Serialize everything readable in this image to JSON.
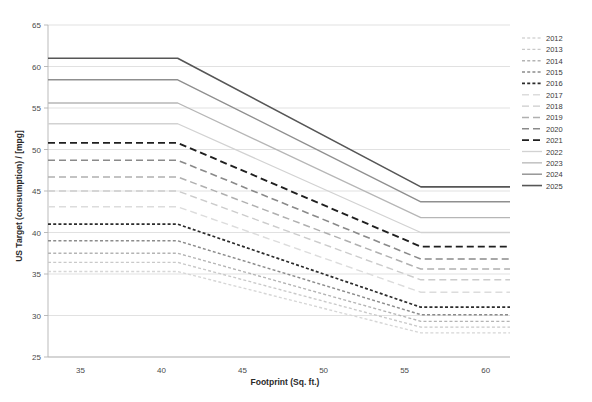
{
  "chart_data": {
    "type": "line",
    "title": "",
    "xlabel": "Footprint (Sq. ft.)",
    "ylabel": "US Target (consumption) / [mpg]",
    "xlim": [
      33,
      61.5
    ],
    "ylim": [
      25,
      65
    ],
    "xticks": [
      35,
      40,
      45,
      50,
      55,
      60
    ],
    "yticks": [
      25,
      30,
      35,
      40,
      45,
      50,
      55,
      60,
      65
    ],
    "grid": true,
    "legend_position": "right",
    "x": [
      33,
      41,
      56,
      61.5
    ],
    "series": [
      {
        "name": "2012",
        "label": "2012",
        "values": [
          35.3,
          35.3,
          27.9,
          27.9
        ],
        "color": "#d6d6d6",
        "dash": "3,2.2",
        "width": 1.35
      },
      {
        "name": "2013",
        "label": "2013",
        "values": [
          36.4,
          36.4,
          28.6,
          28.6
        ],
        "color": "#c9c9c9",
        "dash": "3,2.2",
        "width": 1.35
      },
      {
        "name": "2014",
        "label": "2014",
        "values": [
          37.5,
          37.5,
          29.3,
          29.3
        ],
        "color": "#b4b4b4",
        "dash": "3,2.2",
        "width": 1.35
      },
      {
        "name": "2015",
        "label": "2015",
        "values": [
          39.0,
          39.0,
          30.1,
          30.1
        ],
        "color": "#8c8c8c",
        "dash": "3,2.2",
        "width": 1.45
      },
      {
        "name": "2016",
        "label": "2016",
        "values": [
          41.0,
          41.0,
          31.0,
          31.0
        ],
        "color": "#2b2b2b",
        "dash": "3,2.2",
        "width": 1.7
      },
      {
        "name": "2017",
        "label": "2017",
        "values": [
          43.1,
          43.1,
          32.8,
          32.8
        ],
        "color": "#dcdcdc",
        "dash": "7,4",
        "width": 1.4
      },
      {
        "name": "2018",
        "label": "2018",
        "values": [
          45.0,
          45.0,
          34.3,
          34.3
        ],
        "color": "#cccccc",
        "dash": "7,4",
        "width": 1.4
      },
      {
        "name": "2019",
        "label": "2019",
        "values": [
          46.7,
          46.7,
          35.6,
          35.6
        ],
        "color": "#b0b0b0",
        "dash": "7,4",
        "width": 1.5
      },
      {
        "name": "2020",
        "label": "2020",
        "values": [
          48.7,
          48.7,
          36.8,
          36.8
        ],
        "color": "#8a8a8a",
        "dash": "7,4",
        "width": 1.6
      },
      {
        "name": "2021",
        "label": "2021",
        "values": [
          50.8,
          50.8,
          38.3,
          38.3
        ],
        "color": "#1f1f1f",
        "dash": "7,4",
        "width": 1.9
      },
      {
        "name": "2022",
        "label": "2022",
        "values": [
          53.1,
          53.1,
          40.0,
          40.0
        ],
        "color": "#d2d2d2",
        "dash": "none",
        "width": 1.3
      },
      {
        "name": "2023",
        "label": "2023",
        "values": [
          55.6,
          55.6,
          41.8,
          41.8
        ],
        "color": "#b6b6b6",
        "dash": "none",
        "width": 1.3
      },
      {
        "name": "2024",
        "label": "2024",
        "values": [
          58.4,
          58.4,
          43.7,
          43.7
        ],
        "color": "#8f8f8f",
        "dash": "none",
        "width": 1.4
      },
      {
        "name": "2025",
        "label": "2025",
        "values": [
          61.0,
          61.0,
          45.5,
          45.5
        ],
        "color": "#565656",
        "dash": "none",
        "width": 1.6
      }
    ]
  }
}
